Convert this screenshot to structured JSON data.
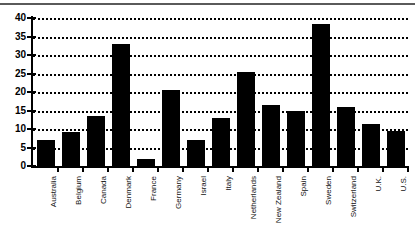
{
  "chart_data": {
    "type": "bar",
    "title": "",
    "subtitle": "",
    "xlabel": "",
    "ylabel": "",
    "ylim": [
      0,
      40
    ],
    "yticks": [
      0,
      5,
      10,
      15,
      20,
      25,
      30,
      35,
      40
    ],
    "ytick_labels": [
      "0",
      "5",
      "10",
      "15",
      "20",
      "25",
      "30",
      "35",
      "40"
    ],
    "grid": "horizontal-dotted",
    "legend": "none",
    "bar_color": "#000000",
    "categories": [
      "Australia",
      "Belgium",
      "Canada",
      "Denmark",
      "France",
      "Germany",
      "Israel",
      "Italy",
      "Netherlands",
      "New Zealand",
      "Spain",
      "Sweden",
      "Switzerland",
      "U.K.",
      "U.S."
    ],
    "values": [
      7,
      9.3,
      13.5,
      33,
      2,
      20.5,
      7,
      13,
      25.3,
      16.5,
      15,
      38.5,
      16,
      11.3,
      9.5
    ]
  }
}
